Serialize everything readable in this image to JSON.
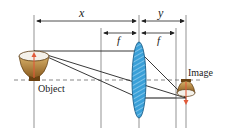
{
  "diagram": {
    "labels": {
      "object_distance": "x",
      "image_distance": "y",
      "focal_left": "f",
      "focal_right": "f",
      "object": "Object",
      "image": "Image"
    },
    "colors": {
      "line": "#333333",
      "lens_fill": "#3aa0d8",
      "lens_stroke": "#1a5f8a",
      "bowl_outer": "#a9792f",
      "bowl_inner": "#f4f1ea",
      "arrow": "#e05a3a"
    }
  }
}
